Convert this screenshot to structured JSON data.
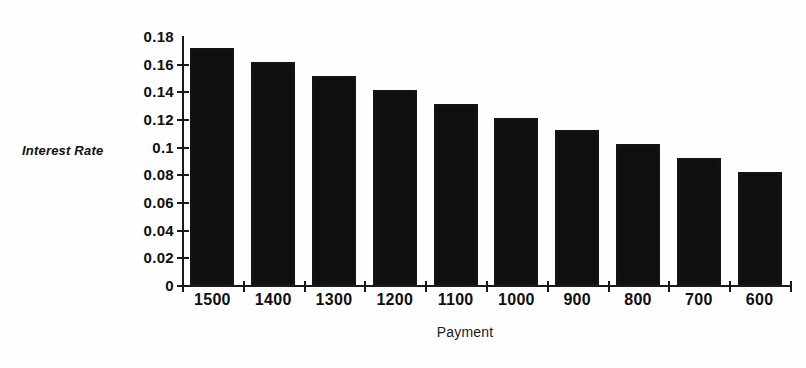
{
  "chart_data": {
    "type": "bar",
    "title": "",
    "subtitle": "",
    "xlabel": "Payment",
    "ylabel": "Interest Rate",
    "categories": [
      "1500",
      "1400",
      "1300",
      "1200",
      "1100",
      "1000",
      "900",
      "800",
      "700",
      "600"
    ],
    "values": [
      0.171,
      0.161,
      0.151,
      0.141,
      0.131,
      0.121,
      0.112,
      0.102,
      0.092,
      0.082
    ],
    "series": [
      {
        "name": "Interest Rate",
        "values": [
          0.171,
          0.161,
          0.151,
          0.141,
          0.131,
          0.121,
          0.112,
          0.102,
          0.092,
          0.082
        ]
      }
    ],
    "ylim": [
      0,
      0.18
    ],
    "ytick_labels": [
      "0.18",
      "0.16",
      "0.14",
      "0.12",
      "0.1",
      "0.08",
      "0.06",
      "0.04",
      "0.02",
      "0"
    ],
    "ytick_values": [
      0.18,
      0.16,
      0.14,
      0.12,
      0.1,
      0.08,
      0.06,
      0.04,
      0.02,
      0
    ],
    "grid": false,
    "legend": false,
    "legend_position": "none",
    "bar_color": "#100f10",
    "axis_color": "#1a1a1a",
    "background_color": "#fefefe",
    "annotations": []
  },
  "axes": {
    "y_title": "Interest Rate",
    "x_title": "Payment"
  }
}
